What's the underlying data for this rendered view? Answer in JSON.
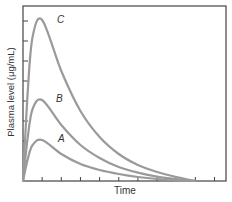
{
  "chart_data": {
    "type": "line",
    "title": "",
    "xlabel": "Time",
    "ylabel": "Plasma level (μg/mL)",
    "x_ticks": 10,
    "y_ticks": 8,
    "xlim": [
      0,
      10.6
    ],
    "ylim": [
      0,
      8.75
    ],
    "grid": false,
    "legend": "inline labels",
    "x": [
      0,
      0.25,
      0.5,
      1,
      2,
      3,
      4,
      5,
      6,
      7,
      8,
      9
    ],
    "series": [
      {
        "name": "C",
        "values": [
          0,
          4.5,
          7.2,
          8.05,
          5.5,
          3.5,
          2.2,
          1.35,
          0.8,
          0.45,
          0.2,
          0
        ]
      },
      {
        "name": "B",
        "values": [
          0,
          2.2,
          3.6,
          4.05,
          2.8,
          1.8,
          1.15,
          0.7,
          0.42,
          0.22,
          0.1,
          0
        ]
      },
      {
        "name": "A",
        "values": [
          0,
          1.1,
          1.8,
          2.05,
          1.35,
          0.85,
          0.55,
          0.35,
          0.2,
          0.1,
          0.04,
          0
        ]
      }
    ],
    "colors": {
      "curve": "#9a9a9a",
      "axis": "#444444"
    }
  },
  "labels": {
    "xlabel": "Time",
    "ylabel": "Plasma level (μg/mL)",
    "series": [
      "C",
      "B",
      "A"
    ]
  }
}
